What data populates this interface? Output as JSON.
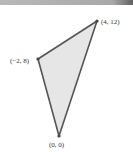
{
  "diagram": {
    "type": "triangle",
    "fill_color": "#e6e6e6",
    "stroke_color": "#555555",
    "vertices": [
      {
        "label": "(4, 12)",
        "x": 4,
        "y": 12
      },
      {
        "label": "(−2, 8)",
        "x": -2,
        "y": 8
      },
      {
        "label": "(0, 0)",
        "x": 0,
        "y": 0
      }
    ]
  }
}
